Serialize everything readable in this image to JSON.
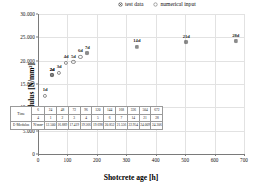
{
  "chart_data": {
    "type": "scatter",
    "title": "",
    "xlabel": "Shotcrete age [h]",
    "ylabel": "E-Modulus [N/mm²]",
    "xlim": [
      0,
      700
    ],
    "ylim": [
      0,
      30000
    ],
    "xticks": [
      "0",
      "100",
      "200",
      "300",
      "400",
      "500",
      "600",
      "700"
    ],
    "yticks": [
      "0",
      "5.000",
      "10.000",
      "15.000",
      "20.000",
      "25.000",
      "30.000"
    ],
    "grid": true,
    "legend_position": "top-right",
    "series": [
      {
        "name": "numerical input",
        "marker": "open-circle",
        "points": [
          {
            "x": 24,
            "y": 12500,
            "label": "1d"
          },
          {
            "x": 48,
            "y": 16889,
            "label": "2d"
          },
          {
            "x": 72,
            "y": 17419,
            "label": "3d"
          },
          {
            "x": 96,
            "y": 19566,
            "label": "4d"
          },
          {
            "x": 120,
            "y": 19698,
            "label": "5d"
          },
          {
            "x": 144,
            "y": 20852,
            "label": "6d"
          }
        ]
      },
      {
        "name": "test data",
        "marker": "circle-cross",
        "points": [
          {
            "x": 48,
            "y": 16889,
            "label": "2d"
          },
          {
            "x": 168,
            "y": 21556,
            "label": "7d"
          },
          {
            "x": 336,
            "y": 22954,
            "label": "14d"
          },
          {
            "x": 504,
            "y": 24009,
            "label": "21d"
          },
          {
            "x": 672,
            "y": 24206,
            "label": "28d"
          }
        ]
      }
    ],
    "legend": [
      {
        "label": "test data",
        "marker": "circle-cross"
      },
      {
        "label": "numerical input",
        "marker": "open-circle"
      }
    ],
    "table": {
      "row_labels": [
        "Time",
        "E-Modulus"
      ],
      "unit_cells": [
        "d",
        "N/mm²"
      ],
      "hours_header": "h",
      "hours": [
        "6",
        "24",
        "48",
        "72",
        "96",
        "120",
        "144",
        "168",
        "336",
        "504",
        "672"
      ],
      "days": [
        "4",
        "1",
        "2",
        "3",
        "4",
        "5",
        "6",
        "7",
        "14",
        "21",
        "28"
      ],
      "emodulus": [
        "12.500",
        "16.889",
        "17.419",
        "19.566",
        "19.698",
        "20.852",
        "21.556",
        "22.954",
        "24.009",
        "24.206"
      ]
    }
  }
}
